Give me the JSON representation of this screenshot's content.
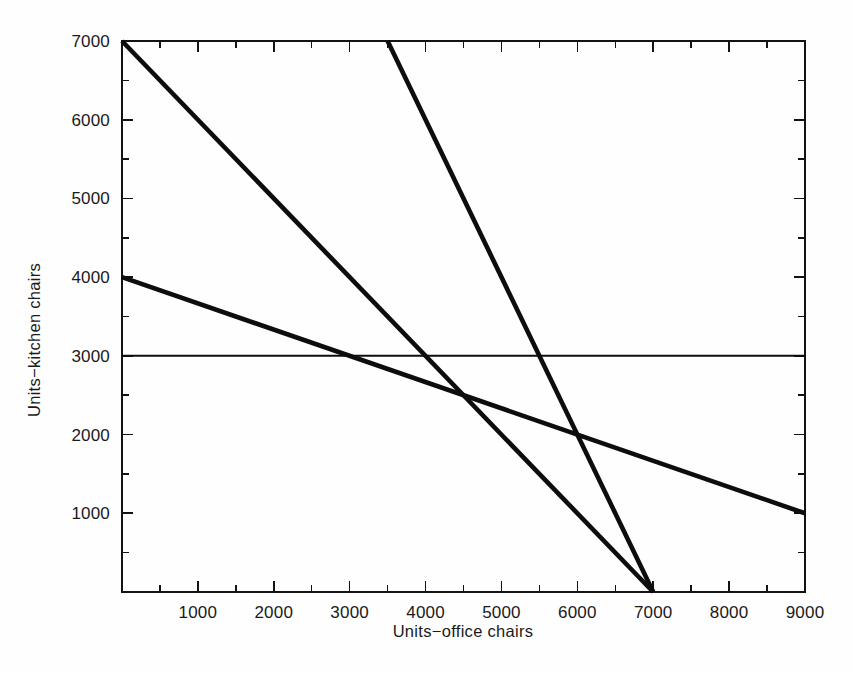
{
  "chart_data": {
    "type": "line",
    "title": "",
    "xlabel": "Units−office chairs",
    "ylabel": "Units−kitchen chairs",
    "xlim": [
      0,
      9000
    ],
    "ylim": [
      0,
      7000
    ],
    "grid": false,
    "legend": "none",
    "x_ticks": [
      0,
      1000,
      2000,
      3000,
      4000,
      5000,
      6000,
      7000,
      8000,
      9000
    ],
    "x_tick_labels": [
      "",
      "1000",
      "2000",
      "3000",
      "4000",
      "5000",
      "6000",
      "7000",
      "8000",
      "9000"
    ],
    "x_minor_tick_step": 500,
    "y_ticks": [
      0,
      1000,
      2000,
      3000,
      4000,
      5000,
      6000,
      7000
    ],
    "y_tick_labels": [
      "",
      "1000",
      "2000",
      "3000",
      "4000",
      "5000",
      "6000",
      "7000"
    ],
    "y_minor_tick_step": 500,
    "series": [
      {
        "name": "constraint-steep",
        "style": "thick",
        "points": [
          [
            3500,
            7000
          ],
          [
            7000,
            0
          ]
        ],
        "slope": -2
      },
      {
        "name": "constraint-medium",
        "style": "thick",
        "points": [
          [
            0,
            7000
          ],
          [
            7000,
            0
          ]
        ],
        "slope": -1
      },
      {
        "name": "constraint-shallow",
        "style": "thick",
        "points": [
          [
            0,
            4000
          ],
          [
            9000,
            1000
          ]
        ],
        "slope": -0.3333
      },
      {
        "name": "constraint-horizontal",
        "style": "thin",
        "points": [
          [
            0,
            3000
          ],
          [
            9000,
            3000
          ]
        ],
        "slope": 0
      }
    ]
  },
  "axes": {
    "x_labels": [
      {
        "value": 1000,
        "text": "1000"
      },
      {
        "value": 2000,
        "text": "2000"
      },
      {
        "value": 3000,
        "text": "3000"
      },
      {
        "value": 4000,
        "text": "4000"
      },
      {
        "value": 5000,
        "text": "5000"
      },
      {
        "value": 6000,
        "text": "6000"
      },
      {
        "value": 7000,
        "text": "7000"
      },
      {
        "value": 8000,
        "text": "8000"
      },
      {
        "value": 9000,
        "text": "9000"
      }
    ],
    "y_labels": [
      {
        "value": 1000,
        "text": "1000"
      },
      {
        "value": 2000,
        "text": "2000"
      },
      {
        "value": 3000,
        "text": "3000"
      },
      {
        "value": 4000,
        "text": "4000"
      },
      {
        "value": 5000,
        "text": "5000"
      },
      {
        "value": 6000,
        "text": "6000"
      },
      {
        "value": 7000,
        "text": "7000"
      }
    ],
    "x_title": "Units−office chairs",
    "y_title": "Units−kitchen chairs"
  },
  "colors": {
    "line": "#0d0d0d",
    "frame": "#131313",
    "text": "#1a1a1a",
    "background": "#fefefe"
  }
}
